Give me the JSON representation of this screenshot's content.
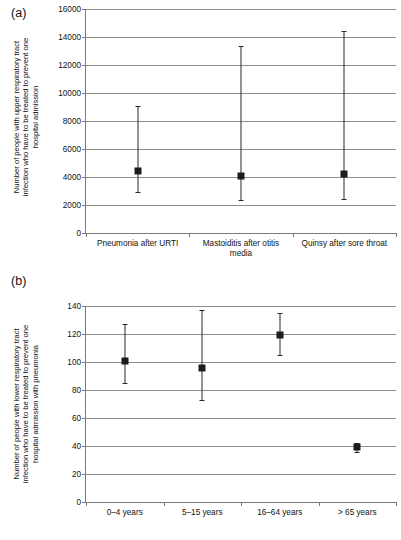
{
  "figure": {
    "panels": [
      {
        "key": "a",
        "label": "(a)",
        "ytitle_lines": [
          "Number of people with upper respiratory tract",
          "infection who have to be treated to prevent one",
          "hospital admission"
        ]
      },
      {
        "key": "b",
        "label": "(b)",
        "ytitle_lines": [
          "Number of people with lower respiratory tract",
          "infection who have to be treated to prevent one",
          "hospital admission with pneumonia"
        ]
      }
    ]
  },
  "chart_data": [
    {
      "type": "scatter",
      "panel": "a",
      "title": "",
      "xlabel": "",
      "ylabel": "Number of people with upper respiratory tract infection who have to be treated to prevent one hospital admission",
      "ylim": [
        0,
        16000
      ],
      "ytick_step": 2000,
      "yticks": [
        0,
        2000,
        4000,
        6000,
        8000,
        10000,
        12000,
        14000,
        16000
      ],
      "ytick_labels": [
        "0",
        "2000",
        "4000",
        "6000",
        "8000",
        "10000",
        "12000",
        "14000",
        "16000"
      ],
      "grid": true,
      "legend": "none",
      "categories": [
        "Pneumonia after URTI",
        "Mastoiditis after otitis media",
        "Quinsy after sore throat"
      ],
      "values": [
        4400,
        4050,
        4250
      ],
      "ci_lower": [
        2900,
        2380,
        2450
      ],
      "ci_upper": [
        9100,
        13350,
        14450
      ],
      "marker": "filled-square",
      "errorbar": "vertical-with-caps"
    },
    {
      "type": "scatter",
      "panel": "b",
      "title": "",
      "xlabel": "",
      "ylabel": "Number of people with lower respiratory tract infection who have to be treated to prevent one hospital admission with pneumonia",
      "ylim": [
        0,
        140
      ],
      "ytick_step": 20,
      "yticks": [
        0,
        20,
        40,
        60,
        80,
        100,
        120,
        140
      ],
      "ytick_labels": [
        "0",
        "20",
        "40",
        "60",
        "80",
        "100",
        "120",
        "140"
      ],
      "grid": true,
      "legend": "none",
      "categories": [
        "0–4 years",
        "5–15 years",
        "16–64 years",
        "> 65 years"
      ],
      "values": [
        101,
        96,
        119,
        39
      ],
      "ci_lower": [
        85,
        73,
        105,
        36
      ],
      "ci_upper": [
        127,
        137,
        135,
        42
      ],
      "marker": "filled-square",
      "errorbar": "vertical-with-caps"
    }
  ],
  "colors": {
    "marker": "#1c1c1c",
    "errorbar": "#2b2b2b",
    "gridline": "#8d8d8d",
    "axis": "#7a7a7a",
    "text": "#111111",
    "background": "#ffffff"
  }
}
